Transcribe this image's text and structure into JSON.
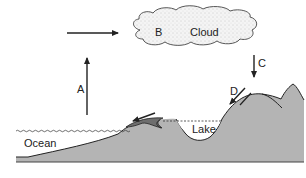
{
  "diagram": {
    "labels": {
      "cloud": "Cloud",
      "ocean": "Ocean",
      "lake": "Lake",
      "a": "A",
      "b": "B",
      "c": "C",
      "d": "D"
    },
    "processes": [
      {
        "id": "A",
        "direction": "up",
        "from": "ocean",
        "to": "atmosphere"
      },
      {
        "id": "B",
        "location": "cloud"
      },
      {
        "id": "C",
        "direction": "down",
        "from": "cloud",
        "to": "mountain"
      },
      {
        "id": "D",
        "direction": "down-left",
        "from": "mountain",
        "to": "lake"
      }
    ],
    "colors": {
      "land": "#b4b4b4",
      "outline": "#222222",
      "cloud_fill": "#f2f2f2",
      "water_line": "#333333"
    }
  }
}
